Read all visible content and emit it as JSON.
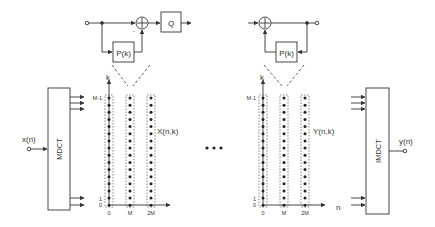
{
  "diagram": {
    "colors": {
      "line": "#333333",
      "dash": "#555555",
      "background": "#ffffff"
    },
    "input": {
      "label": "x(n)"
    },
    "output": {
      "label": "y(n)"
    },
    "analysis": {
      "label": "MDCT"
    },
    "synthesis": {
      "label": "IMDCT"
    },
    "encoder_loop": {
      "predictor_label": "P(k)",
      "quantizer_label": "Q",
      "adder_symbol": "+",
      "sign_minus": "-"
    },
    "decoder_loop": {
      "predictor_label": "P(k)",
      "adder_symbol": "+"
    },
    "left_grid": {
      "k_axis_label": "k",
      "n_axis_ticks": [
        "0",
        "M",
        "2M"
      ],
      "k_axis_ticks": [
        "M-1",
        "1",
        "0"
      ],
      "series_label": "X(n,k)"
    },
    "right_grid": {
      "k_axis_label": "k",
      "n_axis_label": "n",
      "n_axis_ticks": [
        "0",
        "M",
        "2M"
      ],
      "k_axis_ticks": [
        "M-1",
        "1",
        "0"
      ],
      "series_label": "Y(n,k)"
    },
    "ellipsis": "..."
  }
}
